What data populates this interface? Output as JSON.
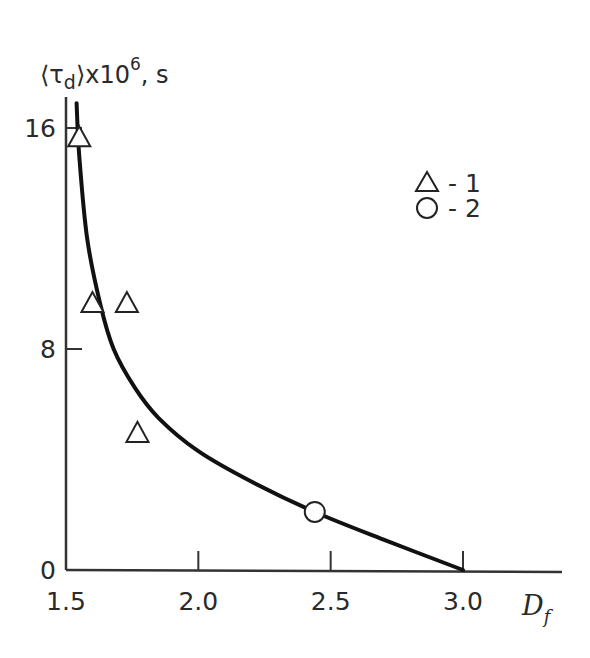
{
  "chart_data": {
    "type": "scatter",
    "title": "",
    "ylabel": {
      "main": "⟨τ",
      "sub": "d",
      "after": "⟩x10",
      "sup": "6",
      "unit": ", s"
    },
    "xlabel": {
      "main": "D",
      "sub": "f"
    },
    "xlim": [
      1.5,
      3.35
    ],
    "ylim": [
      0,
      17.5
    ],
    "x_ticks": [
      {
        "value": 1.5,
        "label": "1.5"
      },
      {
        "value": 2.0,
        "label": "2.0"
      },
      {
        "value": 2.5,
        "label": "2.5"
      },
      {
        "value": 3.0,
        "label": "3.0"
      }
    ],
    "y_ticks": [
      {
        "value": 0,
        "label": "0"
      },
      {
        "value": 8,
        "label": "8"
      },
      {
        "value": 16,
        "label": "16"
      }
    ],
    "grid": false,
    "legend_position": "top-right",
    "series": [
      {
        "name": "1",
        "marker": "triangle",
        "points": [
          {
            "x": 1.55,
            "y": 15.7
          },
          {
            "x": 1.6,
            "y": 9.7
          },
          {
            "x": 1.73,
            "y": 9.7
          },
          {
            "x": 1.77,
            "y": 5.0
          }
        ]
      },
      {
        "name": "2",
        "marker": "circle",
        "points": [
          {
            "x": 2.44,
            "y": 2.1
          }
        ]
      }
    ],
    "fit_curve": {
      "name": "fit",
      "points": [
        {
          "x": 1.54,
          "y": 16.9
        },
        {
          "x": 1.55,
          "y": 15.0
        },
        {
          "x": 1.58,
          "y": 12.0
        },
        {
          "x": 1.63,
          "y": 9.6
        },
        {
          "x": 1.68,
          "y": 8.0
        },
        {
          "x": 1.76,
          "y": 6.6
        },
        {
          "x": 1.85,
          "y": 5.5
        },
        {
          "x": 2.0,
          "y": 4.3
        },
        {
          "x": 2.2,
          "y": 3.2
        },
        {
          "x": 2.44,
          "y": 2.1
        },
        {
          "x": 2.7,
          "y": 1.1
        },
        {
          "x": 3.0,
          "y": 0.0
        }
      ]
    },
    "legend": [
      {
        "marker": "triangle",
        "label": "- 1"
      },
      {
        "marker": "circle",
        "label": "- 2"
      }
    ]
  }
}
